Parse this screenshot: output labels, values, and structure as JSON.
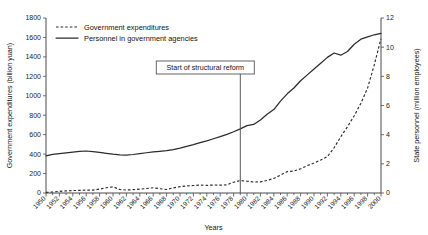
{
  "chart_data": {
    "type": "line",
    "title": "",
    "xlabel": "Years",
    "ylabel": "Government expenditures (billion yuan)",
    "y2label": "State personnel (million employees)",
    "xlim": [
      1950,
      2000
    ],
    "ylim": [
      0,
      1800
    ],
    "y2lim": [
      0,
      12
    ],
    "yticks": [
      0,
      200,
      400,
      600,
      800,
      1000,
      1200,
      1400,
      1600,
      1800
    ],
    "y2ticks": [
      0,
      2,
      4,
      6,
      8,
      10,
      12
    ],
    "xticks": [
      1950,
      1952,
      1954,
      1956,
      1958,
      1960,
      1962,
      1964,
      1966,
      1968,
      1970,
      1972,
      1974,
      1976,
      1978,
      1980,
      1982,
      1984,
      1986,
      1988,
      1990,
      1992,
      1994,
      1996,
      1998,
      2000
    ],
    "grid": false,
    "legend_position": "top-left",
    "x": [
      1950,
      1951,
      1952,
      1953,
      1954,
      1955,
      1956,
      1957,
      1958,
      1959,
      1960,
      1961,
      1962,
      1963,
      1964,
      1965,
      1966,
      1967,
      1968,
      1969,
      1970,
      1971,
      1972,
      1973,
      1974,
      1975,
      1976,
      1977,
      1978,
      1979,
      1980,
      1981,
      1982,
      1983,
      1984,
      1985,
      1986,
      1987,
      1988,
      1989,
      1990,
      1991,
      1992,
      1993,
      1994,
      1995,
      1996,
      1997,
      1998,
      1999,
      2000
    ],
    "series": [
      {
        "name": "Government expenditures",
        "axis": "left",
        "unit": "billion yuan",
        "style": "dashed",
        "values": [
          6,
          10,
          17,
          22,
          25,
          27,
          30,
          30,
          40,
          54,
          64,
          36,
          31,
          34,
          40,
          46,
          54,
          44,
          36,
          53,
          65,
          73,
          77,
          81,
          79,
          82,
          81,
          84,
          111,
          128,
          121,
          113,
          115,
          129,
          150,
          184,
          220,
          226,
          249,
          282,
          308,
          339,
          374,
          465,
          579,
          682,
          794,
          923,
          1080,
          1319,
          1588
        ]
      },
      {
        "name": "Personnel in government agencies",
        "axis": "right",
        "unit": "million employees",
        "style": "solid",
        "values": [
          2.55,
          2.65,
          2.7,
          2.75,
          2.8,
          2.85,
          2.88,
          2.83,
          2.78,
          2.72,
          2.66,
          2.62,
          2.6,
          2.64,
          2.7,
          2.76,
          2.82,
          2.86,
          2.9,
          2.98,
          3.08,
          3.2,
          3.32,
          3.46,
          3.58,
          3.72,
          3.86,
          4.02,
          4.2,
          4.4,
          4.62,
          4.7,
          5.0,
          5.4,
          5.72,
          6.3,
          6.8,
          7.2,
          7.7,
          8.1,
          8.5,
          8.9,
          9.3,
          9.6,
          9.45,
          9.7,
          10.2,
          10.55,
          10.7,
          10.85,
          10.95
        ]
      }
    ],
    "annotations": [
      {
        "text": "Start of structural reform",
        "x": 1979,
        "type": "vertical-line-label"
      }
    ]
  },
  "legend": {
    "items": [
      {
        "label": "Government expenditures",
        "style": "dashed"
      },
      {
        "label": "Personnel in government agencies",
        "style": "solid"
      }
    ]
  }
}
